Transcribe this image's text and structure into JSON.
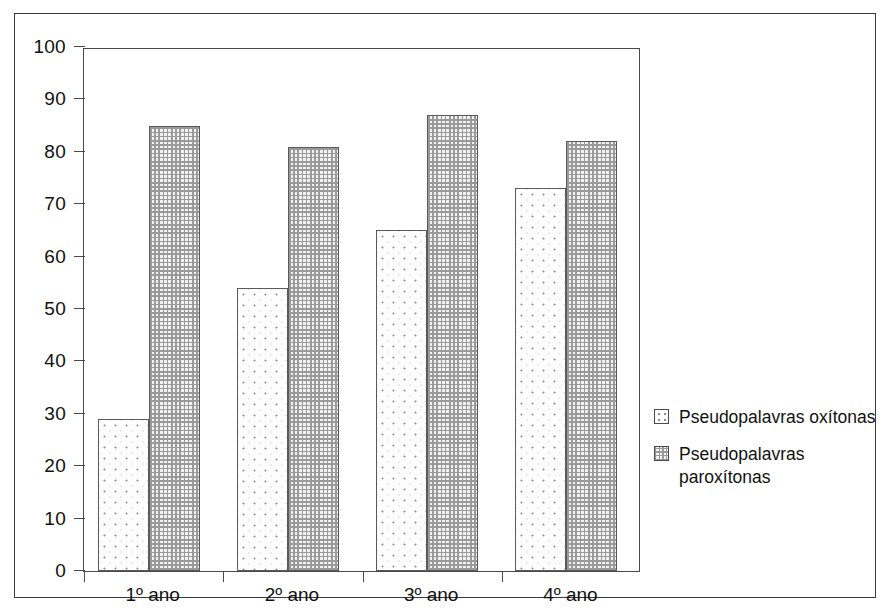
{
  "chart_data": {
    "type": "bar",
    "title": "",
    "subtitle": "",
    "xlabel": "",
    "ylabel": "",
    "categories": [
      "1º ano",
      "2º ano",
      "3º ano",
      "4º ano"
    ],
    "series": [
      {
        "name": "Pseudopalavras oxítonas",
        "values": [
          29,
          54,
          65,
          73
        ],
        "fill": "sparse-dots"
      },
      {
        "name": "Pseudopalavras paroxítonas",
        "values": [
          85,
          81,
          87,
          82
        ],
        "fill": "dense-dots"
      }
    ],
    "ylim": [
      0,
      100
    ],
    "ytick_step": 10,
    "yticks": [
      100,
      90,
      80,
      70,
      60,
      50,
      40,
      30,
      20,
      10,
      0
    ],
    "ytick_labels": [
      "100",
      "90",
      "80",
      "70",
      "60",
      "50",
      "40",
      "30",
      "20",
      "10",
      "0"
    ],
    "grid": false,
    "legend_position": "right",
    "legend_entries": [
      {
        "label": "Pseudopalavras oxítonas",
        "label_lines": [
          "Pseudopalavras oxítonas"
        ]
      },
      {
        "label": "Pseudopalavras paroxítonas",
        "label_lines": [
          "Pseudopalavras",
          "paroxítonas"
        ]
      }
    ],
    "colors": {
      "axis": "#4a4a4a",
      "frame": "#3a3a3a",
      "bar_outline": "#5a5a5a",
      "text": "#111111",
      "background": "#ffffff"
    }
  }
}
